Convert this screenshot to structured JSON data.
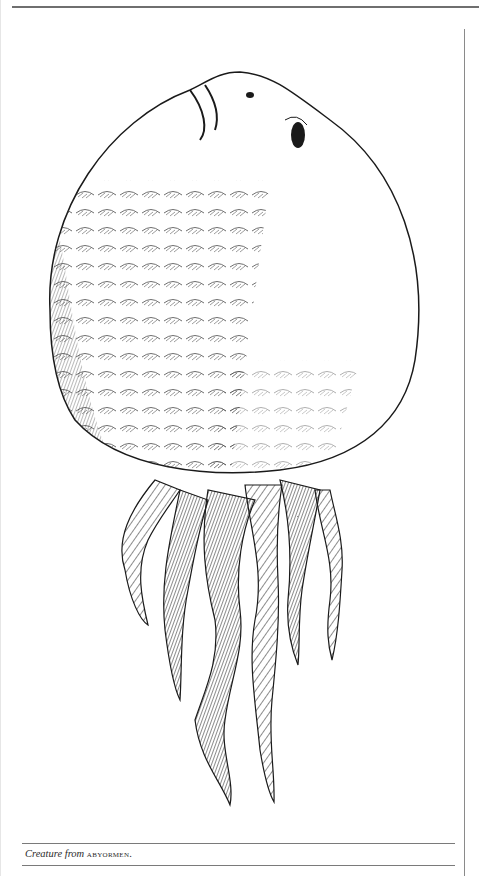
{
  "page": {
    "type": "book-page-figure",
    "colors": {
      "ink": "#1a1a1a",
      "rule": "#7a7a7a",
      "paper": "#ffffff"
    }
  },
  "figure": {
    "style": "pen-and-ink crosshatching"
  },
  "caption": {
    "italic_part": "Creature from",
    "smallcaps_part": "abyormen",
    "trailing": "."
  }
}
